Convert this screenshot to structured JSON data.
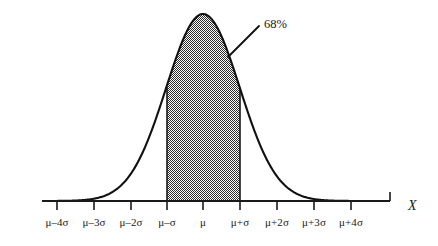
{
  "figure": {
    "kind": "normal-distribution-curve",
    "background_color": "#ffffff",
    "ink_color": "#1a1a1a"
  },
  "annotation": {
    "percent_label": "68%",
    "leader_from_x": 228,
    "leader_from_y": 57,
    "leader_to_x": 259,
    "leader_to_y": 26,
    "label_x": 264,
    "label_y": 18
  },
  "axis": {
    "name": "X",
    "name_x": 408,
    "name_y": 198,
    "baseline_y": 201,
    "start_x": 42,
    "end_x": 390,
    "tick_length": 9,
    "end_cap_length": 9,
    "label_y": 216
  },
  "chart_data": {
    "type": "area",
    "title": "",
    "xlabel": "X",
    "ylabel": "",
    "grid": false,
    "legend": null,
    "distribution": "normal",
    "mean_label": "μ",
    "sd_label": "σ",
    "categories": [
      "μ–4σ",
      "μ–3σ",
      "μ–2σ",
      "μ–σ",
      "μ",
      "μ+σ",
      "μ+2σ",
      "μ+3σ",
      "μ+4σ"
    ],
    "x": [
      -4,
      -3,
      -2,
      -1,
      0,
      1,
      2,
      3,
      4
    ],
    "tick_px": [
      57,
      94,
      131,
      167,
      203,
      240,
      277,
      314,
      351
    ],
    "values": [
      0.0001,
      0.0044,
      0.054,
      0.242,
      0.399,
      0.242,
      0.054,
      0.0044,
      0.0001
    ],
    "peak_px": {
      "x": 203,
      "y": 14
    },
    "curve_height_px": 187,
    "shaded_region": {
      "label": "68%",
      "from_category": "μ–σ",
      "to_category": "μ+σ",
      "from_x": -1,
      "to_x": 1,
      "from_px": 167,
      "to_px": 240,
      "area_percent": 68,
      "fill_style": "checkerboard-dither-50",
      "fill_color": "#808080"
    },
    "xlim": [
      -4.6,
      -4.6
    ],
    "ylim": [
      0,
      0.42
    ]
  },
  "tick_labels": [
    {
      "text": "μ–4σ",
      "x": 57
    },
    {
      "text": "μ–3σ",
      "x": 94
    },
    {
      "text": "μ–2σ",
      "x": 131
    },
    {
      "text": "μ–σ",
      "x": 167
    },
    {
      "text": "μ",
      "x": 203
    },
    {
      "text": "μ+σ",
      "x": 240
    },
    {
      "text": "μ+2σ",
      "x": 277
    },
    {
      "text": "μ+3σ",
      "x": 314
    },
    {
      "text": "μ+4σ",
      "x": 351
    }
  ]
}
